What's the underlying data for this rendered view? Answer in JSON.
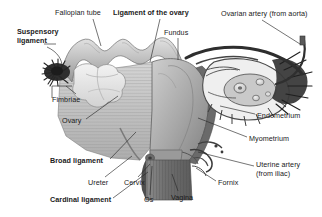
{
  "figure": {
    "background_color": "#ffffff",
    "text_color": "#1a1a1a",
    "leader_line_color": "#2a2a2a",
    "width": 322,
    "height": 217
  },
  "labels": [
    {
      "key": "fallopian_tube",
      "text": "Fallopian tube",
      "bold": false,
      "x": 55,
      "y": 9,
      "align": "left"
    },
    {
      "key": "ligament_of_ovary",
      "text": "Ligament of the ovary",
      "bold": true,
      "x": 113,
      "y": 9,
      "align": "left"
    },
    {
      "key": "ovarian_artery",
      "text": "Ovarian artery (from aorta)",
      "bold": false,
      "x": 221,
      "y": 10,
      "align": "left"
    },
    {
      "key": "suspensory_ligament",
      "text": "Suspensory\nligament",
      "bold": true,
      "x": 17,
      "y": 28,
      "align": "left"
    },
    {
      "key": "fundus",
      "text": "Fundus",
      "bold": false,
      "x": 164,
      "y": 29,
      "align": "left"
    },
    {
      "key": "fimbriae",
      "text": "Fimbriae",
      "bold": false,
      "x": 52,
      "y": 96,
      "align": "left"
    },
    {
      "key": "endometrium",
      "text": "Endometrium",
      "bold": false,
      "x": 257,
      "y": 112,
      "align": "left"
    },
    {
      "key": "ovary",
      "text": "Ovary",
      "bold": false,
      "x": 62,
      "y": 117,
      "align": "left"
    },
    {
      "key": "myometrium",
      "text": "Myometrium",
      "bold": false,
      "x": 249,
      "y": 135,
      "align": "left"
    },
    {
      "key": "broad_ligament",
      "text": "Broad ligament",
      "bold": true,
      "x": 50,
      "y": 157,
      "align": "left"
    },
    {
      "key": "uterine_artery",
      "text": "Uterine artery\n(from iliac)",
      "bold": false,
      "x": 256,
      "y": 161,
      "align": "left"
    },
    {
      "key": "ureter",
      "text": "Ureter",
      "bold": false,
      "x": 88,
      "y": 179,
      "align": "left"
    },
    {
      "key": "cervix",
      "text": "Cervix",
      "bold": false,
      "x": 124,
      "y": 179,
      "align": "left"
    },
    {
      "key": "fornix",
      "text": "Fornix",
      "bold": false,
      "x": 218,
      "y": 179,
      "align": "left"
    },
    {
      "key": "cardinal_ligament",
      "text": "Cardinal ligament",
      "bold": true,
      "x": 50,
      "y": 196,
      "align": "left"
    },
    {
      "key": "os",
      "text": "Os",
      "bold": false,
      "x": 144,
      "y": 196,
      "align": "left"
    },
    {
      "key": "vagina",
      "text": "Vagina",
      "bold": false,
      "x": 171,
      "y": 194,
      "align": "left"
    }
  ],
  "structures": [
    {
      "key": "fallopian-tube",
      "name": "Fallopian tube (left), convoluted"
    },
    {
      "key": "fimbriae-left",
      "name": "Fimbriae, dark fringed funnel"
    },
    {
      "key": "ovary-left",
      "name": "Left ovary, pale lobed body"
    },
    {
      "key": "uterus-body",
      "name": "Uterus body and fundus"
    },
    {
      "key": "broad-ligament-sheet",
      "name": "Broad ligament, striated sheet"
    },
    {
      "key": "cervix-structure",
      "name": "Cervix"
    },
    {
      "key": "vagina-structure",
      "name": "Vagina, striated canal"
    },
    {
      "key": "ovary-right-cutaway",
      "name": "Right ovary cutaway with follicles"
    },
    {
      "key": "fimbriae-right",
      "name": "Right fimbriae fringe"
    },
    {
      "key": "ovarian-artery-vessel",
      "name": "Ovarian artery vessel"
    },
    {
      "key": "uterine-vessels",
      "name": "Uterine artery and venous plexus"
    }
  ],
  "palette": {
    "tissue_light": "#d9d9d9",
    "tissue_mid": "#b6b6b6",
    "tissue_dark": "#8f8f8f",
    "tissue_darker": "#6e6e6e",
    "outline": "#4a4a4a",
    "fimbriae_dark": "#2b2b2b",
    "ovary_pale": "#ececec"
  }
}
